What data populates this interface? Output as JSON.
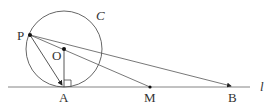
{
  "diagram": {
    "points": {
      "P": {
        "label": "P",
        "x": 30,
        "y": 35
      },
      "O": {
        "label": "O",
        "x": 64,
        "y": 49
      },
      "A": {
        "label": "A",
        "x": 64,
        "y": 87
      },
      "M": {
        "label": "M",
        "x": 150,
        "y": 87
      },
      "B": {
        "label": "B",
        "x": 233,
        "y": 87
      }
    },
    "circle": {
      "label": "C",
      "cx": 64,
      "cy": 49,
      "r": 38
    },
    "line": {
      "label": "l"
    },
    "segments": [
      "PA",
      "PM",
      "PB",
      "OA"
    ],
    "right_angle_at": "A"
  }
}
